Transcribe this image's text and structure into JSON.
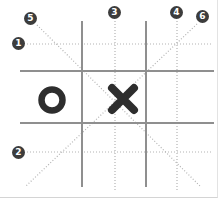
{
  "diagram": {
    "board": {
      "rows": 3,
      "cols": 3,
      "cells": [
        [
          "",
          "",
          ""
        ],
        [
          "O",
          "X",
          ""
        ],
        [
          "",
          "",
          ""
        ]
      ]
    },
    "pieces": [
      {
        "symbol": "O",
        "cell": "middle-left"
      },
      {
        "symbol": "X",
        "cell": "center"
      }
    ],
    "line_markers": [
      {
        "label": "1",
        "marks": "top-row-line"
      },
      {
        "label": "2",
        "marks": "bottom-row-line"
      },
      {
        "label": "3",
        "marks": "middle-column-line"
      },
      {
        "label": "4",
        "marks": "right-column-line"
      },
      {
        "label": "5",
        "marks": "main-diagonal-line"
      },
      {
        "label": "6",
        "marks": "anti-diagonal-line"
      }
    ],
    "colors": {
      "background": "#ffffff",
      "grid_line": "#8f8f8f",
      "dotted_line": "#b3b3b3",
      "piece": "#2e2e2e",
      "marker_bg": "#3c3c3c",
      "marker_fg": "#ffffff"
    }
  }
}
